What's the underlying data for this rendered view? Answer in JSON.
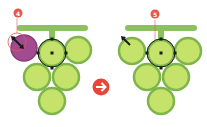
{
  "colors": {
    "grape_fill": "#c5e26a",
    "grape_stroke": "#7db54a",
    "stem": "#8cc060",
    "purple_fill": "#a24b8f",
    "badge": "#e8564b",
    "arrow_circle": "#e8453c",
    "selection": "#1a1a1a"
  },
  "steps": [
    {
      "label": "4"
    },
    {
      "label": "5"
    }
  ],
  "arrow": {
    "icon": "arrow-right-icon",
    "glyph": "➔"
  }
}
